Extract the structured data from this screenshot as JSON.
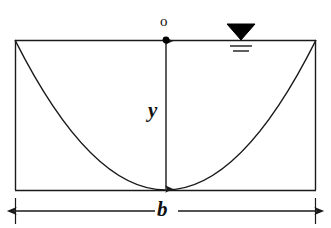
{
  "figure": {
    "stroke_color": "#1a1a1a",
    "fill_color": "#000000",
    "background_color": "#ffffff"
  },
  "labels": {
    "origin": "o",
    "depth": "y",
    "width": "b"
  },
  "symbols": {
    "water_surface": "water-surface-triangle",
    "origin_point": "origin-dot"
  },
  "geometry": {
    "channel": {
      "left_x": 15,
      "right_x": 316,
      "top_y": 40,
      "bottom_y": 190,
      "top_width_px": 301,
      "depth_px": 150
    },
    "parabola": {
      "vertex_x": 166,
      "vertex_y": 190,
      "left_end_x": 15,
      "left_end_y": 40,
      "right_end_x": 316,
      "right_end_y": 40
    },
    "depth_arrow": {
      "x": 166,
      "from_y": 40,
      "to_y": 190
    },
    "width_dimension": {
      "y": 211,
      "from_x": 15,
      "to_x": 316
    },
    "water_symbol": {
      "x": 241,
      "y": 40
    }
  }
}
